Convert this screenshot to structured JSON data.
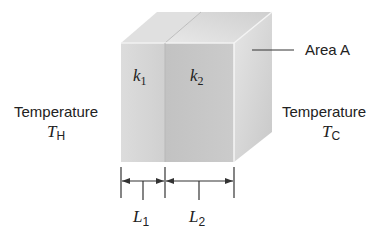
{
  "figure": {
    "type": "composite-wall-heat-conduction",
    "layers": [
      {
        "id": "layer-1",
        "conductivity_symbol": "k",
        "conductivity_subscript": "1",
        "thickness_symbol": "L",
        "thickness_subscript": "1",
        "front_color": "#d6d6d6",
        "top_color": "#e4e4e4"
      },
      {
        "id": "layer-2",
        "conductivity_symbol": "k",
        "conductivity_subscript": "2",
        "thickness_symbol": "L",
        "thickness_subscript": "2",
        "front_color": "#c4c4c4",
        "top_color": "#d2d2d2"
      }
    ],
    "side_face_color": "#dadada",
    "labels": {
      "area": "Area A",
      "hot_side_text": "Temperature",
      "hot_side_symbol": "T",
      "hot_side_subscript": "H",
      "cold_side_text": "Temperature",
      "cold_side_symbol": "T",
      "cold_side_subscript": "C"
    },
    "colors": {
      "line": "#333333",
      "text": "#222222"
    }
  }
}
